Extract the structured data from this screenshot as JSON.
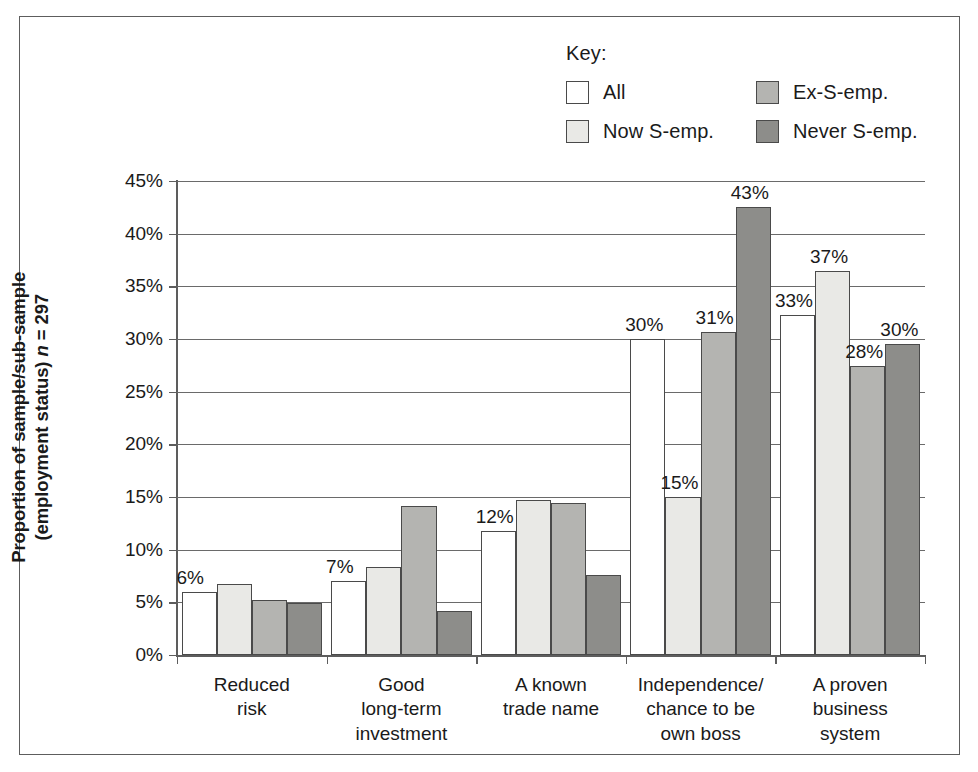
{
  "chart_data": {
    "type": "bar",
    "title": "",
    "xlabel": "",
    "ylabel": "Proportion of sample/sub-sample (employment status) n = 297",
    "ylabel_line1": "Proportion of sample/sub-sample",
    "ylabel_line2_pre": "(employment status) ",
    "ylabel_line2_ital": "n",
    "ylabel_line2_post": " = 297",
    "ylim": [
      0,
      45
    ],
    "ytick_labels": [
      "0%",
      "5%",
      "10%",
      "15%",
      "20%",
      "25%",
      "30%",
      "35%",
      "40%",
      "45%"
    ],
    "ytick_values": [
      0,
      5,
      10,
      15,
      20,
      25,
      30,
      35,
      40,
      45
    ],
    "grid": true,
    "legend_position": "top-right",
    "legend_title": "Key:",
    "categories": [
      "Reduced\nrisk",
      "Good\nlong-term\ninvestment",
      "A known\ntrade name",
      "Independence/\nchance to be\nown boss",
      "A proven\nbusiness\nsystem"
    ],
    "series": [
      {
        "name": "All",
        "color": "#ffffff",
        "values": [
          6.0,
          7.0,
          11.8,
          30.0,
          32.3
        ],
        "labels": [
          "6%",
          "7%",
          "12%",
          "30%",
          "33%"
        ]
      },
      {
        "name": "Now S-emp.",
        "color": "#e9e9e6",
        "values": [
          6.7,
          8.4,
          14.7,
          15.0,
          36.5
        ],
        "labels": [
          "",
          "",
          "",
          "15%",
          "37%"
        ]
      },
      {
        "name": "Ex-S-emp.",
        "color": "#b4b4b1",
        "values": [
          5.2,
          14.1,
          14.4,
          30.7,
          27.4
        ],
        "labels": [
          "",
          "",
          "",
          "31%",
          "28%"
        ]
      },
      {
        "name": "Never S-emp.",
        "color": "#8d8d8a",
        "values": [
          4.9,
          4.2,
          7.6,
          42.5,
          29.5
        ],
        "labels": [
          "",
          "",
          "",
          "43%",
          "30%"
        ]
      }
    ]
  }
}
